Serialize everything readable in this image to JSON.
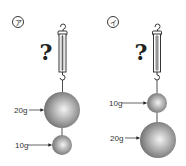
{
  "diagram": {
    "panels": [
      {
        "id": "a",
        "label": "ア",
        "question_mark": "?",
        "top_weight": {
          "label": "20g",
          "mass_g": 20,
          "size": "large"
        },
        "bottom_weight": {
          "label": "10g",
          "mass_g": 10,
          "size": "small"
        }
      },
      {
        "id": "i",
        "label": "イ",
        "question_mark": "?",
        "top_weight": {
          "label": "10g",
          "mass_g": 10,
          "size": "small"
        },
        "bottom_weight": {
          "label": "20g",
          "mass_g": 20,
          "size": "large"
        }
      }
    ],
    "colors": {
      "ball_light": "#f2f2f2",
      "ball_dark": "#6e6e6e",
      "line": "#222222"
    }
  }
}
